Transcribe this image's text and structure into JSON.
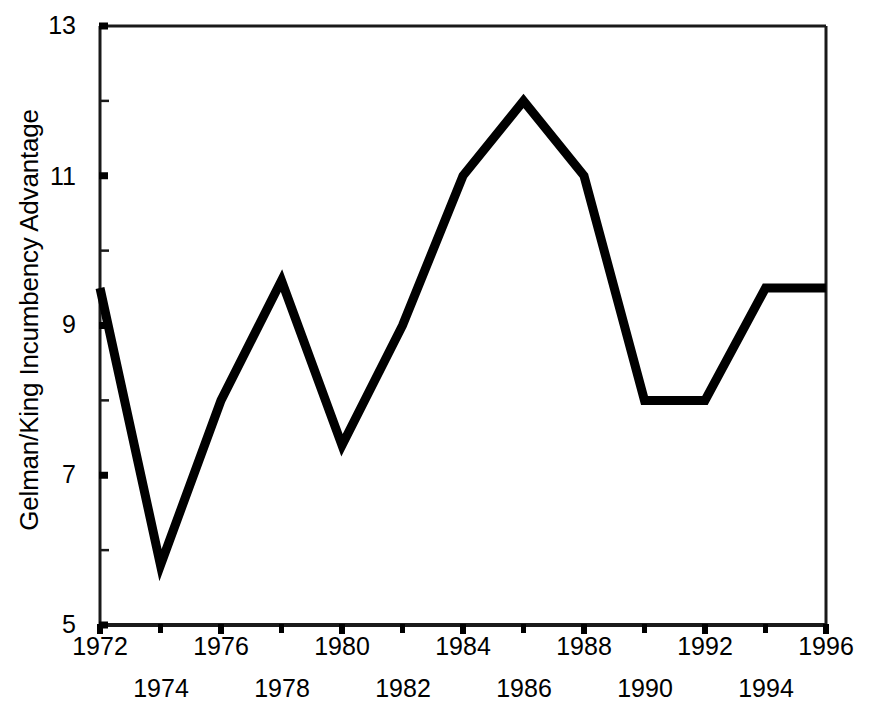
{
  "chart_data": {
    "type": "line",
    "title": "",
    "xlabel": "",
    "ylabel": "Gelman/King Incumbency Advantage",
    "x": [
      1972,
      1974,
      1976,
      1978,
      1980,
      1982,
      1984,
      1986,
      1988,
      1990,
      1992,
      1994,
      1996
    ],
    "values": [
      9.5,
      5.8,
      8.0,
      9.6,
      7.4,
      9.0,
      11.0,
      12.0,
      11.0,
      8.0,
      8.0,
      9.5,
      9.5
    ],
    "series": [
      {
        "name": "Gelman/King Incumbency Advantage",
        "values": [
          9.5,
          5.8,
          8.0,
          9.6,
          7.4,
          9.0,
          11.0,
          12.0,
          11.0,
          8.0,
          8.0,
          9.5,
          9.5
        ]
      }
    ],
    "xlim": [
      1972,
      1996
    ],
    "ylim": [
      5,
      13
    ],
    "y_major_ticks": [
      5,
      7,
      9,
      11,
      13
    ],
    "y_minor_ticks": [
      6,
      8,
      10,
      12
    ],
    "x_ticks": [
      1972,
      1974,
      1976,
      1978,
      1980,
      1982,
      1984,
      1986,
      1988,
      1990,
      1992,
      1994,
      1996
    ],
    "grid": false,
    "legend": null,
    "line_color": "#000000",
    "line_width": 9,
    "axis_color": "#1a1a1a"
  },
  "axis": {
    "y_title": "Gelman/King Incumbency Advantage",
    "y_tick_labels": [
      "13",
      "11",
      "9",
      "7",
      "5"
    ],
    "x_tick_labels_top_row": [
      "1972",
      "1976",
      "1980",
      "1984",
      "1988",
      "1992",
      "1996"
    ],
    "x_tick_labels_bottom_row": [
      "1974",
      "1978",
      "1982",
      "1986",
      "1990",
      "1994"
    ]
  }
}
